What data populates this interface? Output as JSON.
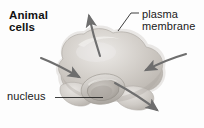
{
  "figure": {
    "kind": "biology-diagram",
    "subject": "animal cell",
    "background_color": "#fdfdfd"
  },
  "title": {
    "line1": "Animal",
    "line2": "cells"
  },
  "labels": {
    "plasma_membrane": {
      "line1": "plasma",
      "line2": "membrane",
      "leader": "diagonal-line"
    },
    "nucleus": {
      "text": "nucleus",
      "leader": "horizontal-line"
    }
  },
  "cell": {
    "body_fill": "#c9c5c0",
    "body_highlight": "#e3e0dc",
    "body_shadow": "#a9a49e",
    "outline_color": "#b4afa9",
    "nucleus_fill": "#bdb8b2",
    "nucleus_ring": "#9c9791"
  },
  "arrows": {
    "color": "#6e6e6e",
    "items": [
      {
        "name": "arrow-out-top",
        "direction": "up-left",
        "meaning": "outward"
      },
      {
        "name": "arrow-in-left",
        "direction": "right-down",
        "meaning": "inward"
      },
      {
        "name": "arrow-in-right",
        "direction": "left-down",
        "meaning": "inward"
      },
      {
        "name": "arrow-out-bottom-right",
        "direction": "down-right",
        "meaning": "outward"
      }
    ]
  }
}
